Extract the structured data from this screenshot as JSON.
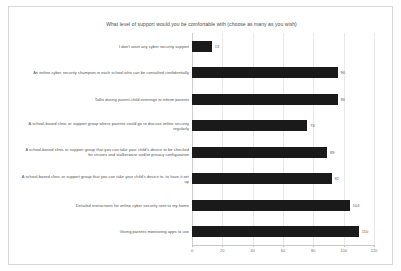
{
  "chart_data": {
    "type": "bar",
    "orientation": "horizontal",
    "title": "What level of support would you be comfortable with (choose as many as you wish)",
    "xlabel": "",
    "ylabel": "",
    "xlim": [
      0,
      120
    ],
    "xticks": [
      0,
      20,
      40,
      60,
      80,
      100,
      120
    ],
    "grid": true,
    "legend": false,
    "bar_color": "#1a1a1a",
    "categories": [
      "I don't want any cyber security support",
      "An online cyber security champion in each school who can be consulted confidentially",
      "Talks during parent-child evenings to inform parents",
      "A school-based clinic or support group where parents could go to discuss online security regularly",
      "A school-based clinic or support group that you can take your child's device to be checked for viruses and stalkerware and/or privacy configuration",
      "A school-based clinic or support group that you can take your child's device to, to have it set up",
      "Detailed instructions for online cyber security sent to my home",
      "Giving parents monitoring apps to use"
    ],
    "values": [
      13,
      96,
      96,
      76,
      89,
      92,
      104,
      110
    ],
    "value_labels": [
      "13",
      "96",
      "96",
      "76",
      "89",
      "92",
      "104",
      "110"
    ]
  }
}
